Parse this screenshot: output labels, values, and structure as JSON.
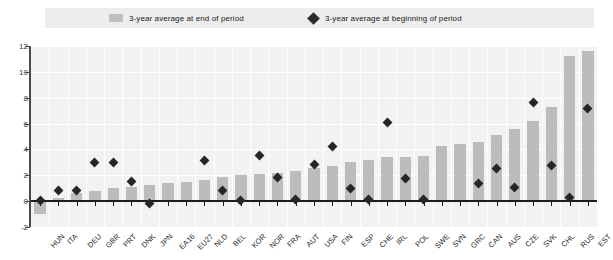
{
  "legend": {
    "items": [
      {
        "label": "3-year average at end of period",
        "marker": "bar-swatch",
        "color": "#bfbfbf"
      },
      {
        "label": "3-year average at beginning of period",
        "marker": "diamond-marker",
        "color": "#2b2b2b"
      }
    ]
  },
  "chart_data": {
    "type": "bar",
    "title": "",
    "subtitle": "",
    "xlabel": "",
    "ylabel": "",
    "ylim": [
      -2,
      12
    ],
    "yticks": [
      -2,
      0,
      2,
      4,
      6,
      8,
      10,
      12
    ],
    "ytick_labels": [
      "-2",
      "0",
      "2",
      "4",
      "6",
      "8",
      "10",
      "12"
    ],
    "grid": true,
    "legend_position": "top",
    "categories": [
      "HUN",
      "ITA",
      "DEU",
      "GBR",
      "PRT",
      "DNK",
      "JPN",
      "EA16",
      "EU27",
      "NLD",
      "BEL",
      "KOR",
      "NOR",
      "FRA",
      "AUT",
      "USA",
      "FIN",
      "ESP",
      "CHE",
      "IRL",
      "POL",
      "SWE",
      "SVN",
      "GRC",
      "CAN",
      "AUS",
      "CZE",
      "SVK",
      "CHL",
      "RUS",
      "EST"
    ],
    "series": [
      {
        "name": "3-year average at end of period",
        "type": "bar",
        "color": "#bcbcbc",
        "values": [
          -1.0,
          0.25,
          0.6,
          0.75,
          1.05,
          1.1,
          1.25,
          1.4,
          1.5,
          1.65,
          1.9,
          2.0,
          2.1,
          2.2,
          2.3,
          2.55,
          2.7,
          3.0,
          3.2,
          3.4,
          3.45,
          3.5,
          4.3,
          4.4,
          4.6,
          5.1,
          5.6,
          6.2,
          7.3,
          11.2,
          11.6
        ]
      },
      {
        "name": "3-year average at beginning of period",
        "type": "scatter",
        "marker": "diamond",
        "color": "#262626",
        "values": [
          0.05,
          0.8,
          0.85,
          3.0,
          3.0,
          1.5,
          -0.15,
          null,
          null,
          3.15,
          0.8,
          0.05,
          3.5,
          1.85,
          0.1,
          2.85,
          4.2,
          0.95,
          0.1,
          6.05,
          1.75,
          0.1,
          null,
          null,
          1.35,
          2.5,
          1.05,
          7.6,
          2.75,
          0.3,
          7.2
        ]
      }
    ]
  }
}
